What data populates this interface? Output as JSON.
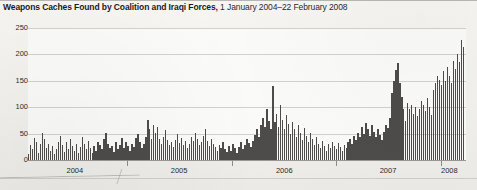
{
  "title": {
    "strong": "Weapons Caches Found by Coalition and Iraqi Forces,",
    "light": " 1 January 2004–22 February 2008"
  },
  "chart_data": {
    "type": "bar",
    "title": "Weapons Caches Found by Coalition and Iraqi Forces, 1 January 2004–22 February 2008",
    "xlabel": "",
    "ylabel": "",
    "ylim": [
      0,
      250
    ],
    "yticks": [
      0,
      50,
      100,
      150,
      200,
      250
    ],
    "ytick_labels": [
      "0",
      "50",
      "100",
      "150",
      "200",
      "250"
    ],
    "grid": true,
    "legend": "none",
    "x_axis_type": "time",
    "x_tick_labels": [
      "2004",
      "2005",
      "2006",
      "2007",
      "2008"
    ],
    "x_tick_positions_frac": [
      0.107,
      0.345,
      0.585,
      0.822,
      0.962
    ],
    "x_boundary_frac": [
      0.226,
      0.465,
      0.704,
      0.943
    ],
    "bar_color": "#4d4c4a",
    "plot_background": "#fbfbf9",
    "interval": "weekly",
    "n_bars": 216,
    "values": [
      12,
      28,
      20,
      42,
      35,
      14,
      30,
      52,
      40,
      22,
      30,
      18,
      26,
      12,
      20,
      34,
      46,
      28,
      16,
      34,
      20,
      40,
      26,
      18,
      30,
      14,
      24,
      44,
      30,
      20,
      36,
      22,
      14,
      26,
      18,
      34,
      28,
      20,
      40,
      52,
      30,
      22,
      26,
      16,
      34,
      20,
      28,
      42,
      22,
      34,
      26,
      18,
      30,
      24,
      42,
      50,
      34,
      22,
      30,
      44,
      75,
      58,
      40,
      66,
      52,
      62,
      40,
      30,
      44,
      56,
      38,
      28,
      34,
      24,
      38,
      50,
      32,
      42,
      28,
      36,
      22,
      30,
      44,
      36,
      52,
      40,
      28,
      34,
      46,
      58,
      36,
      26,
      40,
      30,
      24,
      18,
      28,
      22,
      34,
      20,
      16,
      26,
      18,
      30,
      22,
      14,
      24,
      34,
      20,
      28,
      40,
      32,
      24,
      36,
      48,
      58,
      44,
      66,
      80,
      62,
      96,
      74,
      58,
      140,
      72,
      88,
      62,
      104,
      76,
      58,
      86,
      68,
      50,
      72,
      58,
      44,
      66,
      52,
      38,
      60,
      46,
      34,
      52,
      40,
      28,
      44,
      30,
      22,
      36,
      26,
      18,
      30,
      22,
      34,
      26,
      20,
      32,
      24,
      18,
      28,
      22,
      34,
      40,
      30,
      46,
      38,
      52,
      44,
      62,
      50,
      70,
      58,
      46,
      66,
      54,
      44,
      58,
      48,
      38,
      54,
      66,
      60,
      80,
      126,
      150,
      170,
      184,
      146,
      120,
      96,
      74,
      108,
      96,
      104,
      88,
      100,
      84,
      96,
      112,
      104,
      92,
      118,
      100,
      86,
      132,
      146,
      160,
      152,
      142,
      168,
      150,
      176,
      160,
      146,
      188,
      172,
      200,
      186,
      228,
      214
    ]
  }
}
